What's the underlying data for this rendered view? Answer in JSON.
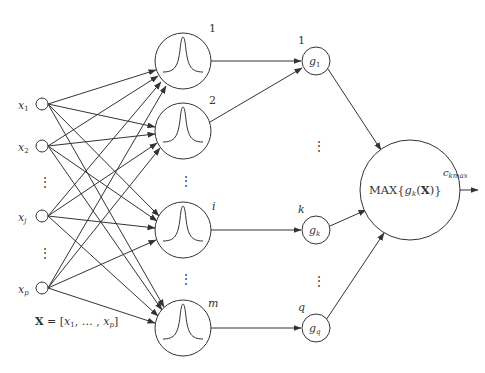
{
  "inputs": {
    "nodes": [
      {
        "label": "x",
        "sub": "1"
      },
      {
        "label": "x",
        "sub": "2"
      },
      {
        "label": "x",
        "sub": "j"
      },
      {
        "label": "x",
        "sub": "p"
      }
    ],
    "vector_label": {
      "bold": "X",
      "eq": " = [",
      "x1": "x",
      "x1sub": "1",
      "mid": ", … , ",
      "xp": "x",
      "xpsub": "p",
      "end": "]"
    }
  },
  "hidden": {
    "nodes": [
      {
        "label": "1"
      },
      {
        "label": "2"
      },
      {
        "label": "i"
      },
      {
        "label": "m"
      }
    ]
  },
  "outputs": {
    "nodes": [
      {
        "label": "1",
        "g": "g",
        "sub": "1"
      },
      {
        "label": "k",
        "g": "g",
        "sub": "k"
      },
      {
        "label": "q",
        "g": "g",
        "sub": "q"
      }
    ]
  },
  "max_node": {
    "label_pre": "MAX{",
    "g": "g",
    "sub": "k",
    "open": "(",
    "X": "X",
    "close": ")}"
  },
  "result": {
    "label": "c",
    "sub": "kmax"
  },
  "ellipsis": "⋮",
  "colors": {
    "stroke": "#333333",
    "background": "#ffffff"
  }
}
